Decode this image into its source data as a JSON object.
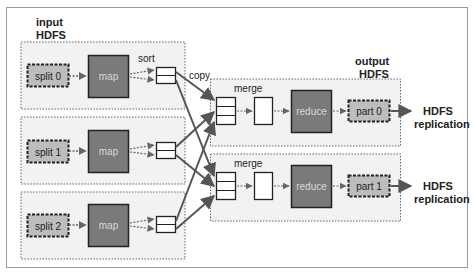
{
  "colors": {
    "frame": "#9a9a9a",
    "group_fill": "#f2f2f2",
    "group_border": "#666666",
    "map_fill": "#7a7a7a",
    "map_text": "#d8d8d8",
    "split_fill": "#bdbdbd",
    "arrow": "#555555",
    "text": "#222222"
  },
  "labels": {
    "input_hdfs": [
      "input",
      "HDFS"
    ],
    "output_hdfs": [
      "output",
      "HDFS"
    ],
    "sort": "sort",
    "copy": "copy",
    "hdfs_replication": [
      "HDFS",
      "replication"
    ]
  },
  "map_tasks": [
    {
      "split": "split 0",
      "map": "map"
    },
    {
      "split": "split 1",
      "map": "map"
    },
    {
      "split": "split 2",
      "map": "map"
    }
  ],
  "reduce_tasks": [
    {
      "merge": "merge",
      "reduce": "reduce",
      "part": "part 0"
    },
    {
      "merge": "merge",
      "reduce": "reduce",
      "part": "part 1"
    }
  ]
}
